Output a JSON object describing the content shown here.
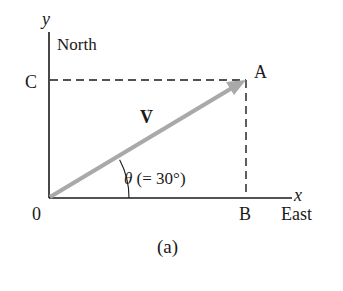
{
  "figure": {
    "caption": "(a)",
    "axes": {
      "y_axis_label": "y",
      "y_direction_label": "North",
      "x_axis_label": "x",
      "x_direction_label": "East",
      "origin_label": "0"
    },
    "points": {
      "A": "A",
      "B": "B",
      "C": "C"
    },
    "vector": {
      "symbol": "V",
      "arrow_glyph": "→",
      "color": "#a9a9a9"
    },
    "angle": {
      "symbol": "θ",
      "value_text": "(= 30°)",
      "degrees": 30
    },
    "colors": {
      "axis": "#1a1a1a",
      "dashed": "#1a1a1a",
      "vector": "#a9a9a9",
      "background": "#ffffff"
    }
  }
}
